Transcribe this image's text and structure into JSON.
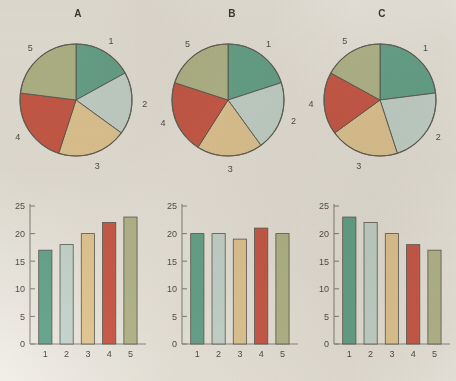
{
  "figure": {
    "background_color": "#f3f1ec",
    "palette": [
      "#6dad97",
      "#cfe0dc",
      "#ecd2a0",
      "#d4604f",
      "#bcc196"
    ],
    "categories": [
      "1",
      "2",
      "3",
      "4",
      "5"
    ]
  },
  "panels": [
    {
      "title": "A",
      "pie_labels": [
        "1",
        "2",
        "3",
        "4",
        "5"
      ],
      "bar_xticks": [
        "1",
        "2",
        "3",
        "4",
        "5"
      ],
      "bar_yticks": [
        "0",
        "5",
        "10",
        "15",
        "20",
        "25"
      ]
    },
    {
      "title": "B",
      "pie_labels": [
        "1",
        "2",
        "3",
        "4",
        "5"
      ],
      "bar_xticks": [
        "1",
        "2",
        "3",
        "4",
        "5"
      ],
      "bar_yticks": [
        "0",
        "5",
        "10",
        "15",
        "20",
        "25"
      ]
    },
    {
      "title": "C",
      "pie_labels": [
        "1",
        "2",
        "3",
        "4",
        "5"
      ],
      "bar_xticks": [
        "1",
        "2",
        "3",
        "4",
        "5"
      ],
      "bar_yticks": [
        "0",
        "5",
        "10",
        "15",
        "20",
        "25"
      ]
    }
  ],
  "chart_data": [
    {
      "type": "pie",
      "title": "A",
      "labels": [
        "1",
        "2",
        "3",
        "4",
        "5"
      ],
      "values": [
        17,
        18,
        20,
        22,
        23
      ],
      "colors": [
        "#6dad97",
        "#cfe0dc",
        "#ecd2a0",
        "#d4604f",
        "#bcc196"
      ],
      "start_angle_deg": 0,
      "direction": "clockwise",
      "legend": "none",
      "labels_position": "outside"
    },
    {
      "type": "bar",
      "title": "A",
      "categories": [
        "1",
        "2",
        "3",
        "4",
        "5"
      ],
      "values": [
        17,
        18,
        20,
        22,
        23
      ],
      "colors": [
        "#6dad97",
        "#cfe0dc",
        "#ecd2a0",
        "#d4604f",
        "#bcc196"
      ],
      "xlabel": "",
      "ylabel": "",
      "ylim": [
        0,
        25
      ],
      "yticks": [
        0,
        5,
        10,
        15,
        20,
        25
      ],
      "grid": false,
      "legend": "none"
    },
    {
      "type": "pie",
      "title": "B",
      "labels": [
        "1",
        "2",
        "3",
        "4",
        "5"
      ],
      "values": [
        20,
        20,
        19,
        21,
        20
      ],
      "colors": [
        "#6dad97",
        "#cfe0dc",
        "#ecd2a0",
        "#d4604f",
        "#bcc196"
      ],
      "start_angle_deg": 0,
      "direction": "clockwise",
      "legend": "none",
      "labels_position": "outside"
    },
    {
      "type": "bar",
      "title": "B",
      "categories": [
        "1",
        "2",
        "3",
        "4",
        "5"
      ],
      "values": [
        20,
        20,
        19,
        21,
        20
      ],
      "colors": [
        "#6dad97",
        "#cfe0dc",
        "#ecd2a0",
        "#d4604f",
        "#bcc196"
      ],
      "xlabel": "",
      "ylabel": "",
      "ylim": [
        0,
        25
      ],
      "yticks": [
        0,
        5,
        10,
        15,
        20,
        25
      ],
      "grid": false,
      "legend": "none"
    },
    {
      "type": "pie",
      "title": "C",
      "labels": [
        "1",
        "2",
        "3",
        "4",
        "5"
      ],
      "values": [
        23,
        22,
        20,
        18,
        17
      ],
      "colors": [
        "#6dad97",
        "#cfe0dc",
        "#ecd2a0",
        "#d4604f",
        "#bcc196"
      ],
      "start_angle_deg": 0,
      "direction": "clockwise",
      "legend": "none",
      "labels_position": "outside"
    },
    {
      "type": "bar",
      "title": "C",
      "categories": [
        "1",
        "2",
        "3",
        "4",
        "5"
      ],
      "values": [
        23,
        22,
        20,
        18,
        17
      ],
      "colors": [
        "#6dad97",
        "#cfe0dc",
        "#ecd2a0",
        "#d4604f",
        "#bcc196"
      ],
      "xlabel": "",
      "ylabel": "",
      "ylim": [
        0,
        25
      ],
      "yticks": [
        0,
        5,
        10,
        15,
        20,
        25
      ],
      "grid": false,
      "legend": "none"
    }
  ]
}
